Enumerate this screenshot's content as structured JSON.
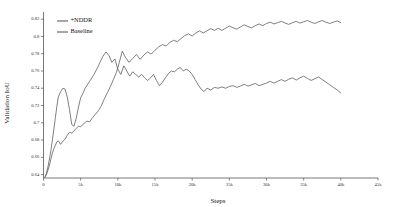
{
  "chart_data": {
    "type": "line",
    "title": "",
    "xlabel": "Steps",
    "ylabel": "Validation  IoU",
    "xlim": [
      0,
      45000
    ],
    "ylim": [
      0.636,
      0.826
    ],
    "grid": false,
    "legend_position": "top-left",
    "xtick_labels": [
      "0",
      "5k",
      "10k",
      "15k",
      "20k",
      "25k",
      "30k",
      "35k",
      "40k",
      "45k"
    ],
    "xtick_values": [
      0,
      5000,
      10000,
      15000,
      20000,
      25000,
      30000,
      35000,
      40000,
      45000
    ],
    "ytick_labels": [
      "0.64",
      "0.66",
      "0.68",
      "0.7",
      "0.72",
      "0.74",
      "0.76",
      "0.78",
      "0.8",
      "0.82"
    ],
    "ytick_values": [
      0.64,
      0.66,
      0.68,
      0.7,
      0.72,
      0.74,
      0.76,
      0.78,
      0.8,
      0.82
    ],
    "series": [
      {
        "name": "+NDDR",
        "color": "#555555",
        "x": [
          200,
          400,
          600,
          800,
          1000,
          1200,
          1400,
          1600,
          1800,
          2000,
          2300,
          2600,
          2900,
          3200,
          3500,
          3800,
          4100,
          4400,
          4700,
          5000,
          5400,
          5800,
          6200,
          6600,
          7000,
          7400,
          7800,
          8200,
          8600,
          9000,
          9400,
          9800,
          10200,
          10600,
          11000,
          11500,
          12000,
          12500,
          13000,
          13500,
          14000,
          14500,
          15000,
          15500,
          16000,
          16500,
          17000,
          17500,
          18000,
          18500,
          19000,
          19500,
          20000,
          20500,
          21000,
          21500,
          22000,
          22500,
          23000,
          23500,
          24000,
          24500,
          25000,
          25500,
          26000,
          26500,
          27000,
          27500,
          28000,
          28500,
          29000,
          29500,
          30000,
          30500,
          31000,
          31500,
          32000,
          32500,
          33000,
          33500,
          34000,
          34500,
          35000,
          35500,
          36000,
          36500,
          37000,
          37500,
          38000,
          38500,
          39000,
          39500,
          40000
        ],
        "y": [
          0.637,
          0.64,
          0.645,
          0.651,
          0.658,
          0.665,
          0.67,
          0.674,
          0.678,
          0.679,
          0.675,
          0.6785,
          0.681,
          0.6855,
          0.689,
          0.688,
          0.6905,
          0.6935,
          0.696,
          0.6955,
          0.6985,
          0.702,
          0.701,
          0.706,
          0.71,
          0.714,
          0.72,
          0.728,
          0.735,
          0.742,
          0.75,
          0.758,
          0.77,
          0.783,
          0.776,
          0.77,
          0.7745,
          0.779,
          0.7735,
          0.7785,
          0.782,
          0.7795,
          0.784,
          0.788,
          0.7905,
          0.789,
          0.793,
          0.7955,
          0.794,
          0.7975,
          0.801,
          0.803,
          0.8005,
          0.804,
          0.8065,
          0.804,
          0.8065,
          0.809,
          0.807,
          0.8095,
          0.807,
          0.8095,
          0.812,
          0.81,
          0.8085,
          0.811,
          0.8135,
          0.8115,
          0.81,
          0.8125,
          0.8145,
          0.8125,
          0.815,
          0.8165,
          0.8145,
          0.816,
          0.8175,
          0.8155,
          0.814,
          0.816,
          0.8175,
          0.8155,
          0.817,
          0.8185,
          0.8165,
          0.815,
          0.817,
          0.8185,
          0.8165,
          0.815,
          0.8165,
          0.818,
          0.816
        ]
      },
      {
        "name": "Baseline",
        "color": "#555555",
        "x": [
          200,
          400,
          600,
          800,
          1000,
          1200,
          1400,
          1600,
          1800,
          2000,
          2300,
          2600,
          2900,
          3200,
          3500,
          3800,
          4100,
          4400,
          4700,
          5000,
          5300,
          5600,
          5900,
          6200,
          6500,
          6800,
          7100,
          7400,
          7700,
          8000,
          8400,
          8800,
          9200,
          9600,
          10000,
          10400,
          10800,
          11200,
          11600,
          12000,
          12400,
          12800,
          13200,
          13600,
          14000,
          14400,
          14800,
          15200,
          15600,
          16000,
          16400,
          16800,
          17200,
          17600,
          18000,
          18400,
          18800,
          19200,
          19600,
          20000,
          20400,
          20800,
          21200,
          21600,
          22000,
          22500,
          23000,
          23500,
          24000,
          24500,
          25000,
          25500,
          26000,
          26500,
          27000,
          27500,
          28000,
          28500,
          29000,
          29500,
          30000,
          30500,
          31000,
          31500,
          32000,
          32500,
          33000,
          33500,
          34000,
          34500,
          35000,
          35500,
          36000,
          36500,
          37000,
          37500,
          38000,
          38500,
          39000,
          39500,
          40000
        ],
        "y": [
          0.637,
          0.642,
          0.649,
          0.658,
          0.668,
          0.68,
          0.693,
          0.706,
          0.719,
          0.73,
          0.736,
          0.74,
          0.739,
          0.73,
          0.715,
          0.698,
          0.696,
          0.705,
          0.718,
          0.729,
          0.734,
          0.74,
          0.744,
          0.748,
          0.752,
          0.756,
          0.761,
          0.766,
          0.772,
          0.777,
          0.782,
          0.778,
          0.77,
          0.774,
          0.762,
          0.756,
          0.766,
          0.76,
          0.754,
          0.759,
          0.756,
          0.753,
          0.756,
          0.752,
          0.749,
          0.752,
          0.756,
          0.749,
          0.743,
          0.747,
          0.752,
          0.757,
          0.76,
          0.759,
          0.762,
          0.764,
          0.76,
          0.762,
          0.76,
          0.756,
          0.75,
          0.744,
          0.739,
          0.736,
          0.74,
          0.738,
          0.741,
          0.74,
          0.7415,
          0.74,
          0.742,
          0.743,
          0.741,
          0.7425,
          0.7445,
          0.7425,
          0.744,
          0.7455,
          0.743,
          0.7445,
          0.746,
          0.748,
          0.746,
          0.748,
          0.75,
          0.748,
          0.7505,
          0.752,
          0.7495,
          0.752,
          0.754,
          0.7515,
          0.749,
          0.751,
          0.753,
          0.75,
          0.747,
          0.744,
          0.741,
          0.738,
          0.7345
        ]
      }
    ],
    "legend": [
      {
        "label": "+NDDR",
        "color": "#555555"
      },
      {
        "label": "Baseline",
        "color": "#555555"
      }
    ]
  }
}
